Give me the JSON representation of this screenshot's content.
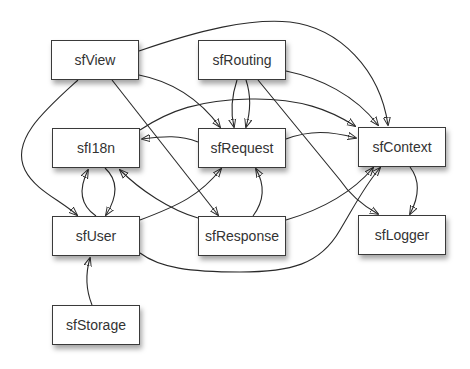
{
  "diagram": {
    "type": "dependency-graph",
    "nodes": [
      {
        "id": "sfView",
        "label": "sfView",
        "x": 51,
        "y": 40
      },
      {
        "id": "sfRouting",
        "label": "sfRouting",
        "x": 198,
        "y": 40
      },
      {
        "id": "sfI18n",
        "label": "sfI18n",
        "x": 52,
        "y": 128
      },
      {
        "id": "sfRequest",
        "label": "sfRequest",
        "x": 198,
        "y": 128
      },
      {
        "id": "sfContext",
        "label": "sfContext",
        "x": 358,
        "y": 127
      },
      {
        "id": "sfUser",
        "label": "sfUser",
        "x": 52,
        "y": 216
      },
      {
        "id": "sfResponse",
        "label": "sfResponse",
        "x": 198,
        "y": 216
      },
      {
        "id": "sfLogger",
        "label": "sfLogger",
        "x": 358,
        "y": 215
      },
      {
        "id": "sfStorage",
        "label": "sfStorage",
        "x": 52,
        "y": 305
      }
    ],
    "edges": [
      {
        "from": "sfView",
        "to": "sfContext"
      },
      {
        "from": "sfView",
        "to": "sfRequest"
      },
      {
        "from": "sfView",
        "to": "sfResponse"
      },
      {
        "from": "sfView",
        "to": "sfUser"
      },
      {
        "from": "sfRouting",
        "to": "sfRequest"
      },
      {
        "from": "sfRouting",
        "to": "sfRequest"
      },
      {
        "from": "sfRouting",
        "to": "sfContext"
      },
      {
        "from": "sfRouting",
        "to": "sfLogger"
      },
      {
        "from": "sfI18n",
        "to": "sfContext"
      },
      {
        "from": "sfRequest",
        "to": "sfI18n"
      },
      {
        "from": "sfRequest",
        "to": "sfContext"
      },
      {
        "from": "sfUser",
        "to": "sfI18n"
      },
      {
        "from": "sfI18n",
        "to": "sfUser"
      },
      {
        "from": "sfResponse",
        "to": "sfI18n"
      },
      {
        "from": "sfUser",
        "to": "sfRequest"
      },
      {
        "from": "sfResponse",
        "to": "sfRequest"
      },
      {
        "from": "sfResponse",
        "to": "sfContext"
      },
      {
        "from": "sfUser",
        "to": "sfContext"
      },
      {
        "from": "sfContext",
        "to": "sfLogger"
      },
      {
        "from": "sfStorage",
        "to": "sfUser"
      }
    ],
    "colors": {
      "stroke": "#2a2a2a",
      "node_border": "#3a3a3a",
      "node_fill": "#ffffff",
      "text": "#333333"
    }
  }
}
